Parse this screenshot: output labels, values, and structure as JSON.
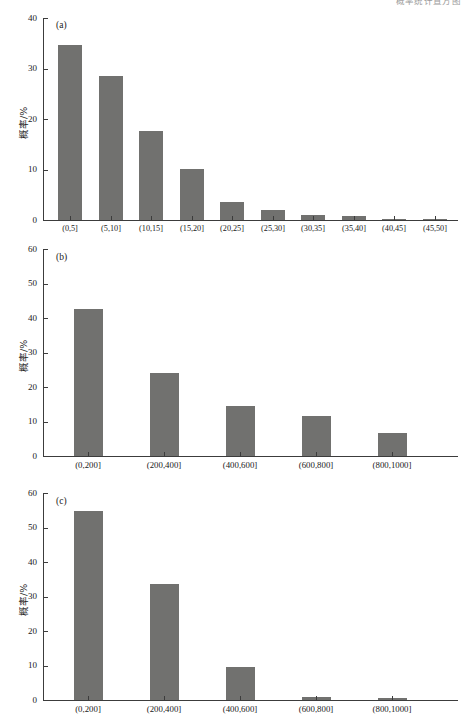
{
  "figure": {
    "clipped_header_text": "概率统计直方图",
    "axis_color": "#3c3c3c",
    "bar_color": "#71716f",
    "background": "#ffffff"
  },
  "chart_data": [
    {
      "type": "bar",
      "panel_tag": "(a)",
      "title": "",
      "xlabel": "",
      "ylabel": "概率/%",
      "ylim": [
        0,
        40
      ],
      "yticks": [
        0,
        10,
        20,
        30,
        40
      ],
      "ytick_labels": [
        "0",
        "10",
        "20",
        "30",
        "40"
      ],
      "grid": false,
      "legend": "none",
      "categories": [
        "(0,5]",
        "(5,10]",
        "(10,15]",
        "(15,20]",
        "(20,25]",
        "(25,30]",
        "(30,35]",
        "(35,40]",
        "(40,45]",
        "(45,50]"
      ],
      "values": [
        34.6,
        28.5,
        17.6,
        10.1,
        3.6,
        1.9,
        1.0,
        0.7,
        0.2,
        0.2
      ]
    },
    {
      "type": "bar",
      "panel_tag": "(b)",
      "title": "",
      "xlabel": "",
      "ylabel": "概率/%",
      "ylim": [
        0,
        60
      ],
      "yticks": [
        0,
        10,
        20,
        30,
        40,
        50,
        60
      ],
      "ytick_labels": [
        "0",
        "10",
        "20",
        "30",
        "40",
        "50",
        "60"
      ],
      "grid": false,
      "legend": "none",
      "categories": [
        "(0,200]",
        "(200,400]",
        "(400,600]",
        "(600,800]",
        "(800,1000]"
      ],
      "values": [
        42.5,
        24.2,
        14.6,
        11.5,
        6.6
      ]
    },
    {
      "type": "bar",
      "panel_tag": "(c)",
      "title": "",
      "xlabel": "",
      "ylabel": "概率/%",
      "ylim": [
        0,
        60
      ],
      "yticks": [
        0,
        10,
        20,
        30,
        40,
        50,
        60
      ],
      "ytick_labels": [
        "0",
        "10",
        "20",
        "30",
        "40",
        "50",
        "60"
      ],
      "grid": false,
      "legend": "none",
      "categories": [
        "(0,200]",
        "(200,400]",
        "(400,600]",
        "(600,800]",
        "(800,1000]"
      ],
      "values": [
        54.8,
        33.5,
        9.5,
        0.8,
        0.7
      ]
    }
  ]
}
